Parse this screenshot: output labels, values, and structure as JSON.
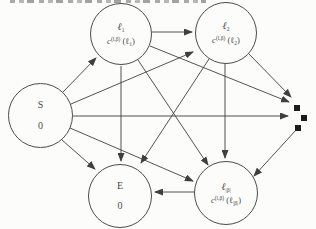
{
  "page": {
    "background": "#fcfcfa"
  },
  "diagram": {
    "colors": {
      "line": "#3f3f3d",
      "node_border": "#4c4c4a",
      "text": "#4a4a48",
      "dot": "#1c1c1a"
    },
    "nodes": {
      "s": {
        "title": "S",
        "value": "0"
      },
      "e": {
        "title": "E",
        "value": "0"
      },
      "l1": {
        "symbol": "ℓ",
        "symbol_sub": "1",
        "cost_base": "c",
        "cost_sup": "(l,β)",
        "cost_open": " (ℓ",
        "cost_sub": "1",
        "cost_close": ")"
      },
      "l2": {
        "symbol": "ℓ",
        "symbol_sub": "2",
        "cost_base": "c",
        "cost_sup": "(l,β)",
        "cost_open": " (ℓ",
        "cost_sub": "2",
        "cost_close": ")"
      },
      "lb": {
        "symbol": "ℓ",
        "symbol_sub": "|β|",
        "cost_base": "c",
        "cost_sup": "(l,β)",
        "cost_open": " (ℓ",
        "cost_sub": "|β|",
        "cost_close": ")"
      }
    },
    "edges": [
      {
        "from": "s",
        "to": "l1",
        "x1": 62,
        "y1": 93,
        "x2": 96,
        "y2": 58
      },
      {
        "from": "s",
        "to": "l2",
        "x1": 71,
        "y1": 104,
        "x2": 193,
        "y2": 52
      },
      {
        "from": "s",
        "to": "dots",
        "x1": 72,
        "y1": 116,
        "x2": 288,
        "y2": 116
      },
      {
        "from": "s",
        "to": "lb",
        "x1": 70,
        "y1": 128,
        "x2": 193,
        "y2": 181
      },
      {
        "from": "s",
        "to": "e",
        "x1": 62,
        "y1": 140,
        "x2": 95,
        "y2": 169
      },
      {
        "from": "l1",
        "to": "l2",
        "x1": 152,
        "y1": 32,
        "x2": 192,
        "y2": 32
      },
      {
        "from": "l1",
        "to": "e",
        "x1": 121,
        "y1": 66,
        "x2": 121,
        "y2": 161
      },
      {
        "from": "l1",
        "to": "lb",
        "x1": 138,
        "y1": 60,
        "x2": 208,
        "y2": 165
      },
      {
        "from": "l1",
        "to": "dots",
        "x1": 150,
        "y1": 46,
        "x2": 289,
        "y2": 102
      },
      {
        "from": "l2",
        "to": "e",
        "x1": 209,
        "y1": 59,
        "x2": 141,
        "y2": 163
      },
      {
        "from": "l2",
        "to": "lb",
        "x1": 225,
        "y1": 64,
        "x2": 225,
        "y2": 158
      },
      {
        "from": "l2",
        "to": "dots",
        "x1": 249,
        "y1": 54,
        "x2": 291,
        "y2": 97
      },
      {
        "from": "lb",
        "to": "e",
        "x1": 194,
        "y1": 192,
        "x2": 155,
        "y2": 192
      },
      {
        "from": "dots",
        "to": "lb",
        "x1": 296,
        "y1": 130,
        "x2": 254,
        "y2": 176
      }
    ],
    "dots": [
      {
        "x": 294,
        "y": 105
      },
      {
        "x": 301,
        "y": 115
      },
      {
        "x": 295,
        "y": 125
      }
    ]
  }
}
